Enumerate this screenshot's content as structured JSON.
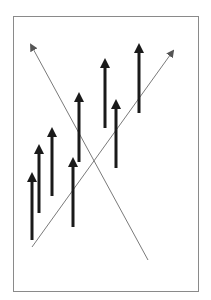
{
  "diagram": {
    "colors": {
      "background": "#ffffff",
      "frame": "#8a8a8a",
      "thick_arrow": "#1a1a1a",
      "thin_line": "#7a7a7a"
    },
    "thick_arrows": [
      {
        "id": "arrow-1",
        "order": 1
      },
      {
        "id": "arrow-2",
        "order": 2
      },
      {
        "id": "arrow-3",
        "order": 3
      },
      {
        "id": "arrow-4",
        "order": 4
      },
      {
        "id": "arrow-5",
        "order": 5
      },
      {
        "id": "arrow-6",
        "order": 6
      },
      {
        "id": "arrow-7",
        "order": 7
      },
      {
        "id": "arrow-8",
        "order": 8
      }
    ],
    "thin_arrows": [
      {
        "id": "diagonal-falling",
        "direction": "up-left"
      },
      {
        "id": "diagonal-rising",
        "direction": "up-right"
      }
    ]
  }
}
